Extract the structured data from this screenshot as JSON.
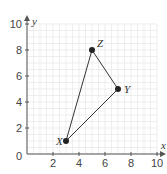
{
  "chart_data": {
    "type": "scatter",
    "title": "",
    "xlabel": "x",
    "ylabel": "y",
    "xlim": [
      0,
      10
    ],
    "ylim": [
      0,
      10
    ],
    "grid": true,
    "x_ticks": [
      "2",
      "4",
      "6",
      "8",
      "10"
    ],
    "y_ticks": [
      "2",
      "4",
      "6",
      "8",
      "10"
    ],
    "origin_label": "0",
    "points": [
      {
        "name": "X",
        "x": 3,
        "y": 1
      },
      {
        "name": "Y",
        "x": 7,
        "y": 5
      },
      {
        "name": "Z",
        "x": 5,
        "y": 8
      }
    ],
    "polygon": [
      "X",
      "Y",
      "Z"
    ]
  }
}
